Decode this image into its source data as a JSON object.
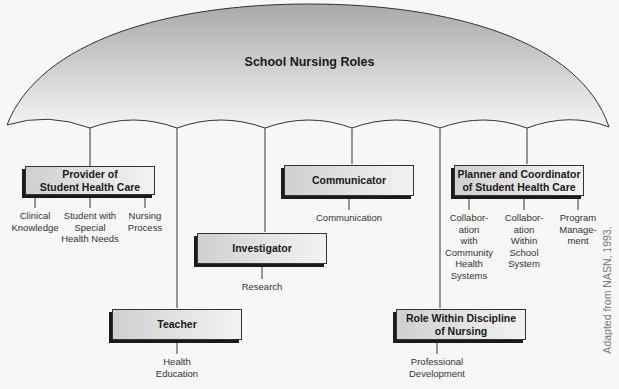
{
  "title": "School Nursing Roles",
  "colors": {
    "canopy_top": "#a9a9a9",
    "canopy_bottom": "#f5f5f5",
    "box_left": "#cfcfcf",
    "box_right": "#f2f2f2",
    "line": "#333333"
  },
  "roles": [
    {
      "id": "provider",
      "label_lines": [
        "Provider of",
        "Student Health Care"
      ],
      "subs": [
        {
          "lines": [
            "Clinical",
            "Knowledge"
          ]
        },
        {
          "lines": [
            "Student with",
            "Special",
            "Health Needs"
          ]
        },
        {
          "lines": [
            "Nursing",
            "Process"
          ]
        }
      ]
    },
    {
      "id": "teacher",
      "label_lines": [
        "Teacher"
      ],
      "subs": [
        {
          "lines": [
            "Health",
            "Education"
          ]
        }
      ]
    },
    {
      "id": "investigator",
      "label_lines": [
        "Investigator"
      ],
      "subs": [
        {
          "lines": [
            "Research"
          ]
        }
      ]
    },
    {
      "id": "communicator",
      "label_lines": [
        "Communicator"
      ],
      "subs": [
        {
          "lines": [
            "Communication"
          ]
        }
      ]
    },
    {
      "id": "role-within-discipline",
      "label_lines": [
        "Role Within Discipline",
        "of Nursing"
      ],
      "subs": [
        {
          "lines": [
            "Professional",
            "Development"
          ]
        }
      ]
    },
    {
      "id": "planner",
      "label_lines": [
        "Planner and Coordinator",
        "of Student Health Care"
      ],
      "subs": [
        {
          "lines": [
            "Collabor-",
            "ation",
            "with",
            "Community",
            "Health",
            "Systems"
          ]
        },
        {
          "lines": [
            "Collabor-",
            "ation",
            "Within",
            "School",
            "System"
          ]
        },
        {
          "lines": [
            "Program",
            "Manage-",
            "ment"
          ]
        }
      ]
    }
  ],
  "credit": "Adapted from NASN, 1993."
}
